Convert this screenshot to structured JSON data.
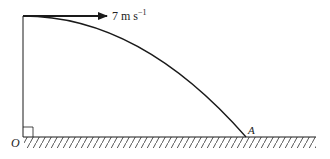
{
  "diagram": {
    "type": "projectile-motion",
    "velocity_label": {
      "value": "7",
      "unit_base": "m s",
      "unit_exponent": "−1"
    },
    "origin_label": "O",
    "landing_point_label": "A",
    "right_angle_marker": true,
    "ground": "hatched horizontal surface",
    "colors": {
      "line": "#1a1a1a",
      "hatch": "#555555"
    }
  }
}
